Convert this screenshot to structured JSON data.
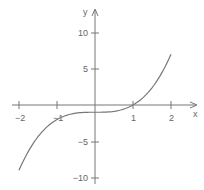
{
  "chart_data": {
    "type": "line",
    "title": "",
    "function": "y = x^3 - 1",
    "xlabel": "x",
    "ylabel": "y",
    "xlim": [
      -2.2,
      2.5
    ],
    "ylim": [
      -10.5,
      12.5
    ],
    "x_ticks": [
      -2,
      -1,
      1,
      2
    ],
    "x_tick_labels": [
      "−2",
      "−1",
      "1",
      "2"
    ],
    "y_ticks": [
      10,
      5,
      -5,
      -10
    ],
    "y_tick_labels": [
      "10",
      "5",
      "−5",
      "−10"
    ],
    "grid": false,
    "legend": null,
    "series": [
      {
        "name": "y = x^3 - 1",
        "x": [
          -2,
          -1.75,
          -1.5,
          -1.25,
          -1,
          -0.75,
          -0.5,
          -0.25,
          0,
          0.25,
          0.5,
          0.75,
          1,
          1.25,
          1.5,
          1.75,
          2
        ],
        "y": [
          -9,
          -6.36,
          -4.38,
          -2.95,
          -2,
          -1.42,
          -1.13,
          -1.02,
          -1,
          -0.98,
          -0.88,
          -0.58,
          0,
          0.95,
          2.38,
          4.36,
          7
        ]
      }
    ],
    "colors": {
      "axis": "#666666",
      "curve": "#777777"
    }
  }
}
